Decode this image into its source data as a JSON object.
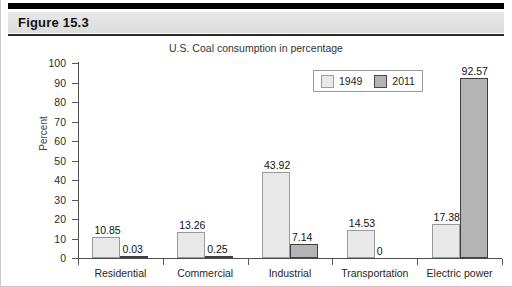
{
  "header": {
    "figure_label": "Figure 15.3"
  },
  "chart_data": {
    "type": "bar",
    "title": "U.S. Coal consumption in percentage",
    "xlabel": "",
    "ylabel": "Percent",
    "ylim": [
      0,
      100
    ],
    "ytick_step": 10,
    "yticks": [
      0,
      10,
      20,
      30,
      40,
      50,
      60,
      70,
      80,
      90,
      100
    ],
    "grid": false,
    "legend_position": "top-right",
    "categories": [
      "Residential",
      "Commercial",
      "Industrial",
      "Transportation",
      "Electric power"
    ],
    "series": [
      {
        "name": "1949",
        "color": "#e9e9e9",
        "border_color": "#9a9a9a",
        "values": [
          10.85,
          13.26,
          43.92,
          14.53,
          17.38
        ],
        "labels": [
          "10.85",
          "13.26",
          "43.92",
          "14.53",
          "17.38"
        ]
      },
      {
        "name": "2011",
        "color": "#b4b4b4",
        "border_color": "#3f3f3f",
        "values": [
          0.03,
          0.25,
          7.14,
          0,
          92.57
        ],
        "labels": [
          "0.03",
          "0.25",
          "7.14",
          "0",
          "92.57"
        ]
      }
    ]
  }
}
